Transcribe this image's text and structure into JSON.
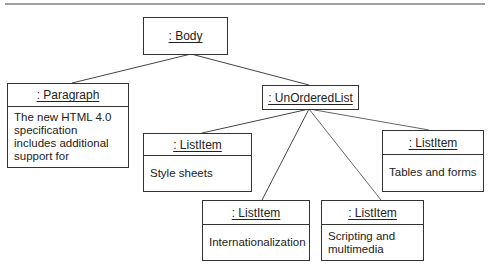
{
  "diagram": {
    "type": "uml-object-diagram",
    "nodes": {
      "body": {
        "label": ": Body"
      },
      "paragraph": {
        "label": ": Paragraph",
        "text": "The new HTML 4.0 specification includes additional support for"
      },
      "unordered_list": {
        "label": ": UnOrderedList"
      },
      "item_style": {
        "label": ": ListItem",
        "text": "Style sheets"
      },
      "item_tables": {
        "label": ": ListItem",
        "text": "Tables and forms"
      },
      "item_intl": {
        "label": ": ListItem",
        "text": "Internationalization"
      },
      "item_script": {
        "label": ": ListItem",
        "text": "Scripting and multimedia"
      }
    },
    "edges": [
      {
        "from": "body",
        "to": "paragraph"
      },
      {
        "from": "body",
        "to": "unordered_list"
      },
      {
        "from": "unordered_list",
        "to": "item_style"
      },
      {
        "from": "unordered_list",
        "to": "item_tables"
      },
      {
        "from": "unordered_list",
        "to": "item_intl"
      },
      {
        "from": "unordered_list",
        "to": "item_script"
      }
    ]
  }
}
